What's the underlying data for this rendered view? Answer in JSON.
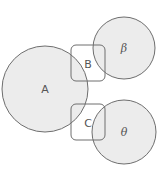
{
  "diagram": {
    "colors": {
      "circle_fill": "#ececec",
      "stroke": "#6e6e6e",
      "box_fill": "none",
      "label": "#555555",
      "background": "#ffffff"
    },
    "circles": [
      {
        "id": "A",
        "label": "A",
        "cx": 45,
        "cy": 89,
        "r": 43
      },
      {
        "id": "beta",
        "label": "β",
        "cx": 124,
        "cy": 48,
        "r": 31
      },
      {
        "id": "theta",
        "label": "θ",
        "cx": 124,
        "cy": 132,
        "r": 32
      }
    ],
    "boxes": [
      {
        "id": "B",
        "label": "B",
        "x": 71,
        "y": 45,
        "w": 34,
        "h": 36,
        "rx": 5
      },
      {
        "id": "C",
        "label": "C",
        "x": 71,
        "y": 104,
        "w": 34,
        "h": 36,
        "rx": 5
      }
    ],
    "labels": {
      "A": "A",
      "beta": "β",
      "theta": "θ",
      "B": "B",
      "C": "C"
    }
  }
}
